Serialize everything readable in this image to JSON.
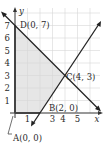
{
  "diagram": {
    "axes": {
      "x_label": "x",
      "y_label": "y"
    },
    "x_ticks": [
      "1",
      "3",
      "4",
      "5"
    ],
    "y_ticks": [
      "1",
      "2",
      "3",
      "4",
      "5",
      "6",
      "7"
    ],
    "points": {
      "A": "A(0, 0)",
      "B": "B(2, 0)",
      "C": "C(4, 3)",
      "D": "D(0, 7)"
    },
    "lines": [
      {
        "name": "line through D(0,7) and C(4,3)",
        "equation": "x + y = 7"
      },
      {
        "name": "line through B(2,0) and C(4,3)",
        "equation": "3x - 2y = 6"
      }
    ],
    "shaded_region": "polygon A(0,0), B(2,0), C(4,3), D(0,7)",
    "colors": {
      "grid": "#d9d9d9",
      "shade": "#e6e6e6",
      "line": "#222222"
    }
  }
}
